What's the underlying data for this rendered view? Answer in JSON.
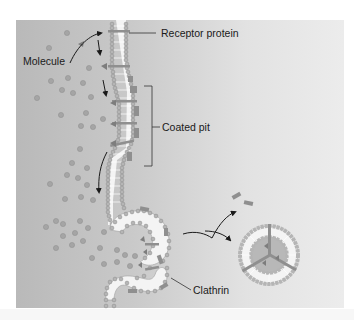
{
  "diagram": {
    "labels": {
      "receptor": "Receptor protein",
      "molecule": "Molecule",
      "coated_pit": "Coated pit",
      "clathrin": "Clathrin"
    },
    "colors": {
      "background_left": "#b9b9b9",
      "background_right": "#ececec",
      "phospholipid_head": "#b5b5b5",
      "phospholipid_head_stroke": "#8a8a8a",
      "membrane_core": "#f4f4f4",
      "clathrin": "#8f8f8f",
      "molecule_dot": "#a5a5a5",
      "arrow": "#1a1a1a"
    }
  }
}
